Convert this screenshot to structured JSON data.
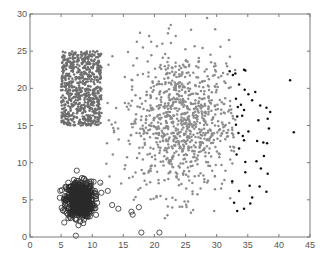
{
  "chart_data": {
    "type": "scatter",
    "title": "",
    "xlabel": "",
    "ylabel": "",
    "xlim": [
      0,
      45
    ],
    "ylim": [
      0,
      30
    ],
    "xticks": [
      0,
      5,
      10,
      15,
      20,
      25,
      30,
      35,
      40,
      45
    ],
    "yticks": [
      0,
      5,
      10,
      15,
      20,
      25,
      30
    ],
    "grid": false,
    "legend": null,
    "series": [
      {
        "name": "uniform-square-cluster",
        "marker": "dot",
        "color": "#6e6e6e",
        "distribution": "uniform",
        "x_range": [
          5,
          11.5
        ],
        "y_range": [
          15,
          25
        ],
        "count": 700
      },
      {
        "name": "dense-gaussian-cluster",
        "marker": "circle",
        "color": "#2a2a2a",
        "distribution": "gaussian",
        "center": [
          8,
          5
        ],
        "std": [
          1.1,
          1.2
        ],
        "count": 600,
        "outliers": [
          [
            12.5,
            6.2
          ],
          [
            11.3,
            7.3
          ],
          [
            10.8,
            4.6
          ],
          [
            13.2,
            4.3
          ],
          [
            14.2,
            3.8
          ],
          [
            16.3,
            3.4
          ],
          [
            16.5,
            3.0
          ],
          [
            17.5,
            4.0
          ],
          [
            17.9,
            0.6
          ],
          [
            20.8,
            0.6
          ]
        ]
      },
      {
        "name": "broad-gray-cloud",
        "marker": "dot",
        "color": "#8c8c8c",
        "distribution": "gaussian",
        "center": [
          24.5,
          15.5
        ],
        "std": [
          4.6,
          4.8
        ],
        "count": 900,
        "x_clip": [
          11,
          33
        ],
        "y_clip": [
          2,
          29.8
        ]
      },
      {
        "name": "black-cluster",
        "marker": "dot",
        "color": "#111111",
        "points": [
          [
            32.1,
            22.3
          ],
          [
            32.6,
            21.8
          ],
          [
            33.0,
            22.0
          ],
          [
            34.4,
            22.5
          ],
          [
            34.6,
            22.4
          ],
          [
            41.8,
            21.1
          ],
          [
            33.6,
            20.5
          ],
          [
            34.5,
            19.8
          ],
          [
            35.1,
            19.2
          ],
          [
            36.2,
            19.5
          ],
          [
            35.7,
            18.4
          ],
          [
            37.0,
            17.7
          ],
          [
            38.0,
            17.4
          ],
          [
            38.6,
            16.8
          ],
          [
            33.1,
            18.6
          ],
          [
            33.4,
            17.5
          ],
          [
            33.9,
            17.8
          ],
          [
            34.4,
            17.1
          ],
          [
            34.1,
            16.3
          ],
          [
            33.3,
            16.2
          ],
          [
            36.7,
            15.7
          ],
          [
            38.2,
            15.9
          ],
          [
            38.4,
            14.6
          ],
          [
            42.4,
            14.1
          ],
          [
            33.1,
            15.1
          ],
          [
            33.5,
            14.0
          ],
          [
            34.2,
            13.6
          ],
          [
            34.4,
            13.0
          ],
          [
            35.1,
            14.2
          ],
          [
            36.5,
            12.9
          ],
          [
            37.5,
            12.7
          ],
          [
            38.1,
            12.6
          ],
          [
            33.6,
            11.9
          ],
          [
            33.2,
            11.1
          ],
          [
            34.6,
            10.1
          ],
          [
            36.4,
            10.2
          ],
          [
            34.6,
            8.7
          ],
          [
            37.6,
            10.9
          ],
          [
            37.1,
            9.2
          ],
          [
            38.2,
            8.5
          ],
          [
            35.3,
            6.9
          ],
          [
            36.9,
            6.8
          ],
          [
            38.0,
            6.1
          ],
          [
            32.5,
            7.5
          ],
          [
            33.6,
            6.2
          ],
          [
            32.8,
            4.6
          ],
          [
            35.7,
            5.3
          ],
          [
            35.4,
            4.5
          ],
          [
            34.4,
            3.8
          ],
          [
            33.3,
            3.5
          ]
        ]
      }
    ]
  }
}
